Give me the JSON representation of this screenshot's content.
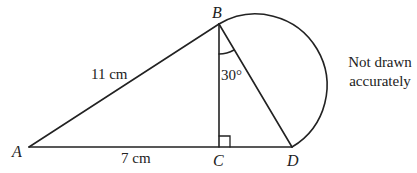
{
  "diagram": {
    "points": {
      "A": {
        "label": "A",
        "x": 29,
        "y": 147
      },
      "B": {
        "label": "B",
        "x": 219,
        "y": 24
      },
      "C": {
        "label": "C",
        "x": 219,
        "y": 147
      },
      "D": {
        "label": "D",
        "x": 292,
        "y": 147
      }
    },
    "labels": {
      "AB_length": "11 cm",
      "AC_length": "7 cm",
      "angle_CBD": "30°"
    },
    "note": {
      "line1": "Not drawn",
      "line2": "accurately"
    },
    "colors": {
      "stroke": "#222222",
      "background": "#ffffff"
    }
  }
}
